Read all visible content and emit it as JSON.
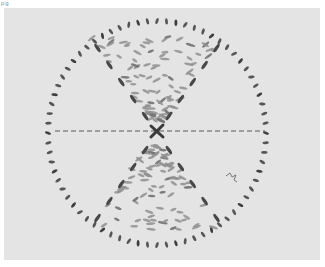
{
  "figure": {
    "corner_fragment": "pg",
    "colors": {
      "background": "#e4e4e4",
      "ring_marks": "#4a4a4a",
      "inner_marks": "#8a8a8a",
      "dashed_line": "#5a5a5a",
      "center_cross": "#3a3a3a"
    }
  }
}
